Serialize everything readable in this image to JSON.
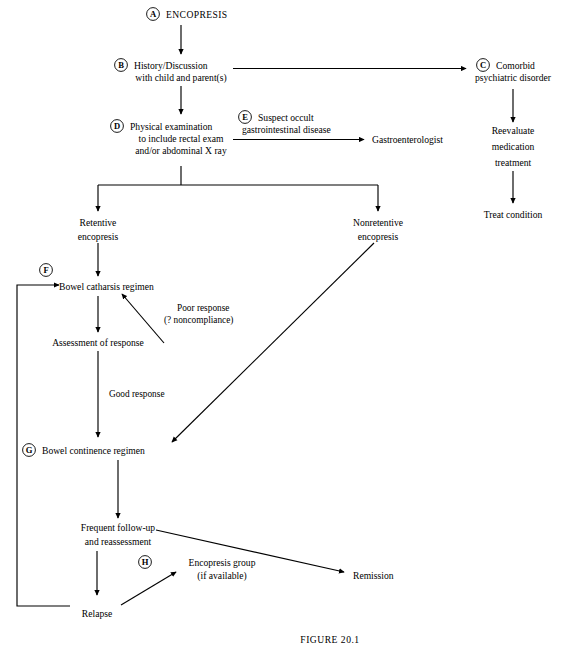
{
  "figure": {
    "caption": "FIGURE 20.1"
  },
  "nodes": {
    "encopresis": {
      "letter": "A",
      "lines": [
        "ENCOPRESIS"
      ]
    },
    "history": {
      "letter": "B",
      "lines": [
        "History/Discussion",
        "with child and parent(s)"
      ]
    },
    "comorbid": {
      "letter": "C",
      "lines": [
        "Comorbid",
        "psychiatric disorder"
      ]
    },
    "physical_exam": {
      "letter": "D",
      "lines": [
        "Physical examination",
        "to include rectal exam",
        "and/or abdominal X ray"
      ]
    },
    "suspect_occult": {
      "letter": "E",
      "lines": [
        "Suspect occult",
        "gastrointestinal disease"
      ]
    },
    "gastroenterologist": {
      "letter": "",
      "lines": [
        "Gastroenterologist"
      ]
    },
    "reevaluate": {
      "letter": "",
      "lines": [
        "Reevaluate",
        "medication",
        "treatment"
      ]
    },
    "treat_condition": {
      "letter": "",
      "lines": [
        "Treat condition"
      ]
    },
    "retentive": {
      "letter": "",
      "lines": [
        "Retentive",
        "encopresis"
      ]
    },
    "nonretentive": {
      "letter": "",
      "lines": [
        "Nonretentive",
        "encopresis"
      ]
    },
    "bowel_catharsis": {
      "letter": "F",
      "lines": [
        "Bowel catharsis regimen"
      ]
    },
    "assessment": {
      "letter": "",
      "lines": [
        "Assessment of response"
      ]
    },
    "bowel_continence": {
      "letter": "G",
      "lines": [
        "Bowel continence regimen"
      ]
    },
    "followup": {
      "letter": "",
      "lines": [
        "Frequent follow-up",
        "and reassessment"
      ]
    },
    "encopresis_group": {
      "letter": "H",
      "lines": [
        "Encopresis group",
        "(if available)"
      ]
    },
    "remission": {
      "letter": "",
      "lines": [
        "Remission"
      ]
    },
    "relapse": {
      "letter": "",
      "lines": [
        "Relapse"
      ]
    }
  },
  "edge_labels": {
    "poor_response": [
      "Poor response",
      "(? noncompliance)"
    ],
    "good_response": [
      "Good response"
    ]
  },
  "style": {
    "stroke": "#000000",
    "background": "#ffffff"
  }
}
